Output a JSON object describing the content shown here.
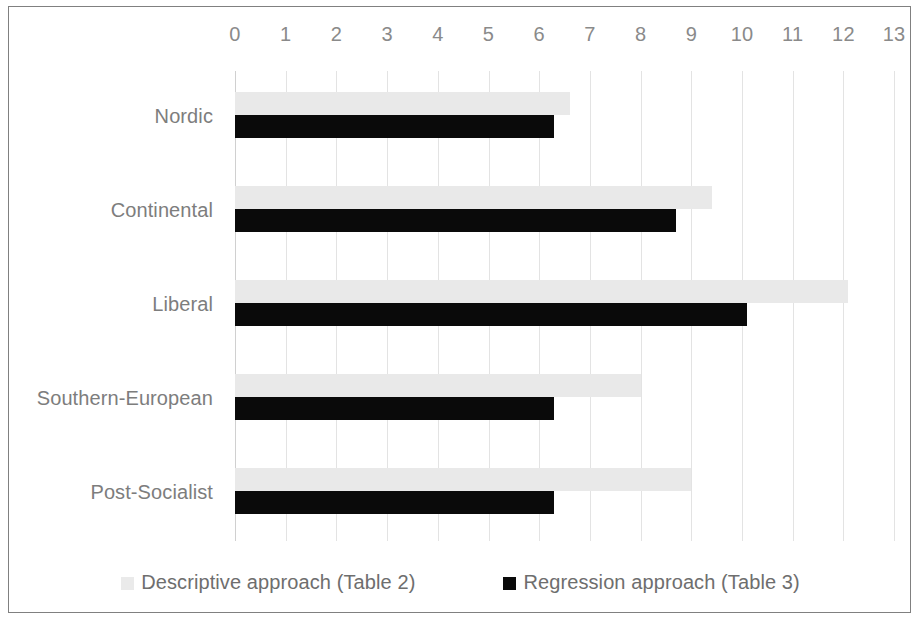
{
  "chart_data": {
    "type": "bar",
    "orientation": "horizontal",
    "title": "",
    "xlabel": "",
    "ylabel": "",
    "xlim": [
      0,
      13
    ],
    "grid": true,
    "legend_position": "bottom",
    "tick_labels": [
      "0",
      "1",
      "2",
      "3",
      "4",
      "5",
      "6",
      "7",
      "8",
      "9",
      "10",
      "11",
      "12",
      "13"
    ],
    "categories": [
      "Nordic",
      "Continental",
      "Liberal",
      "Southern-European",
      "Post-Socialist"
    ],
    "series": [
      {
        "name": "Descriptive approach (Table 2)",
        "color": "#e9e9e9",
        "values": [
          6.6,
          9.4,
          12.1,
          8.0,
          9.0
        ]
      },
      {
        "name": "Regression approach (Table 3)",
        "color": "#0a0a0a",
        "values": [
          6.3,
          8.7,
          10.1,
          6.3,
          6.3
        ]
      }
    ]
  },
  "legend": {
    "items": [
      {
        "label": "Descriptive approach (Table 2)",
        "swatch": "descriptive"
      },
      {
        "label": "Regression approach (Table 3)",
        "swatch": "regression"
      }
    ]
  }
}
